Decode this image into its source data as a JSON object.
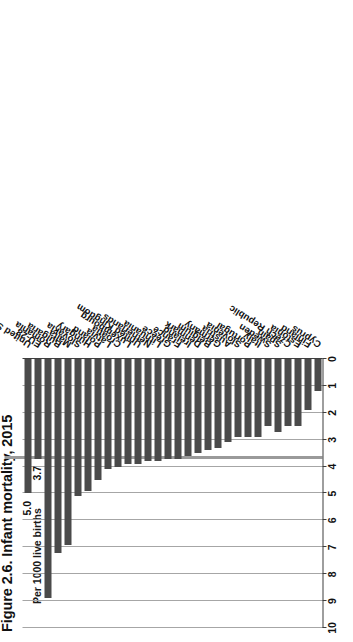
{
  "figure": {
    "title": "Figure 2.6. Infant mortality, 2015",
    "axis_unit_label": "Per 1000 live births"
  },
  "chart_data": {
    "type": "bar",
    "orientation": "horizontal",
    "title": "Figure 2.6. Infant mortality, 2015",
    "xlabel": "Per 1000 live births",
    "ylabel": "",
    "xlim": [
      0,
      10
    ],
    "grid": true,
    "legend": "none",
    "tick_labels": [
      "0",
      "1",
      "2",
      "3",
      "4",
      "5",
      "6",
      "7",
      "8",
      "9",
      "10"
    ],
    "reference_line": {
      "value": 3.7,
      "label": "EU-28 average"
    },
    "bar_color": "#4a4a4a",
    "categories": [
      "United States *",
      "EU-28",
      "Romania",
      "Bulgaria",
      "Malta",
      "Slovakia",
      "Hungary",
      "Poland",
      "Latvia",
      "Croatia",
      "Luxembourg",
      "United Kingdom",
      "Netherlands",
      "Lithuania",
      "Greece",
      "France",
      "Ireland",
      "Denmark",
      "Belgium",
      "Germany",
      "Austria",
      "Slovenia",
      "Portugal",
      "Italy",
      "Sweden",
      "Spain",
      "Czech Republic",
      "Estonia",
      "Finland",
      "Cyprus"
    ],
    "values": [
      5.0,
      3.7,
      8.9,
      7.2,
      6.9,
      5.1,
      4.9,
      4.5,
      4.1,
      4.0,
      3.9,
      3.9,
      3.8,
      3.8,
      3.7,
      3.7,
      3.6,
      3.5,
      3.4,
      3.3,
      3.1,
      2.9,
      2.9,
      2.9,
      2.5,
      2.7,
      2.5,
      2.5,
      1.9,
      1.2
    ],
    "value_labels": [
      {
        "category": "United States *",
        "text": "5.0"
      },
      {
        "category": "EU-28",
        "text": "3.7"
      }
    ]
  }
}
